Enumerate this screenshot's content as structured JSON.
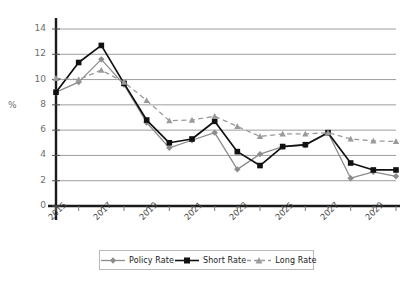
{
  "chart_data": {
    "type": "line",
    "title": "",
    "xlabel": "",
    "ylabel": "%",
    "ylim": [
      0,
      14
    ],
    "yticks": [
      0,
      2,
      4,
      6,
      8,
      10,
      12,
      14
    ],
    "grid": true,
    "legend_position": "bottom",
    "x": [
      2015,
      2016,
      2017,
      2018,
      2019,
      2020,
      2021,
      2022,
      2023,
      2024,
      2025,
      2026,
      2027,
      2028,
      2029,
      2030
    ],
    "xtick_labels": [
      "2015",
      "2017",
      "2019",
      "2021",
      "2023",
      "2025",
      "2027",
      "2029"
    ],
    "xtick_values": [
      2015,
      2017,
      2019,
      2021,
      2023,
      2025,
      2027,
      2029
    ],
    "series": [
      {
        "name": "Policy Rate",
        "color": "#8c8c8c",
        "marker": "diamond",
        "dash": "solid",
        "values": [
          9.0,
          9.8,
          11.6,
          9.6,
          6.6,
          4.6,
          5.2,
          5.8,
          2.9,
          4.1,
          4.7,
          4.8,
          5.8,
          2.2,
          2.7,
          2.35
        ]
      },
      {
        "name": "Short Rate",
        "color": "#111111",
        "marker": "square",
        "dash": "solid",
        "values": [
          9.0,
          11.35,
          12.7,
          9.7,
          6.8,
          5.0,
          5.3,
          6.7,
          4.3,
          3.2,
          4.7,
          4.85,
          5.8,
          3.4,
          2.85,
          2.85
        ]
      },
      {
        "name": "Long Rate",
        "color": "#9a9a9a",
        "marker": "triangle",
        "dash": "dashed",
        "values": [
          10.1,
          10.0,
          10.75,
          9.8,
          8.35,
          6.75,
          6.8,
          7.1,
          6.3,
          5.5,
          5.7,
          5.7,
          5.8,
          5.3,
          5.15,
          5.1
        ]
      }
    ]
  },
  "legend": {
    "items": [
      {
        "label": "Policy Rate"
      },
      {
        "label": "Short Rate"
      },
      {
        "label": "Long Rate"
      }
    ]
  },
  "colors": {
    "gridline": "#9d9d9d",
    "axis": "#1a1a1a",
    "background": "#ffffff",
    "policy": "#8c8c8c",
    "short": "#111111",
    "long": "#9a9a9a"
  }
}
